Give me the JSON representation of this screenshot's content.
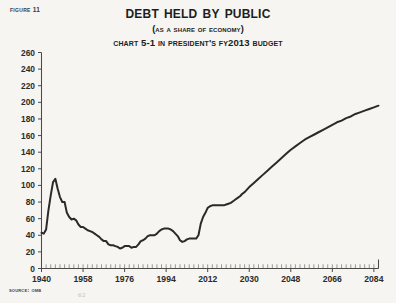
{
  "figure": {
    "label": "Figure 11"
  },
  "titles": {
    "main": "Debt Held by Public",
    "sub1": "(As a Share of Economy)",
    "sub2": "Chart 5-1 in President's FY2013 Budget"
  },
  "source": {
    "text": "Source: OMB"
  },
  "artifact": {
    "page_mark": "62"
  },
  "colors": {
    "background": "#f6f5f2",
    "line": "#2a2a2a",
    "axis": "#4a4a4a",
    "text": "#1d1d1d"
  },
  "chart_data": {
    "type": "line",
    "title": "Debt Held by Public",
    "subtitle": "(As a Share of Economy)",
    "subtitle2": "Chart 5-1 in President's FY2013 Budget",
    "xlabel": "",
    "ylabel": "",
    "xlim": [
      1940,
      2086
    ],
    "ylim": [
      0,
      260
    ],
    "ytick_values": [
      0,
      20,
      40,
      60,
      80,
      100,
      120,
      140,
      160,
      180,
      200,
      220,
      240,
      260
    ],
    "ytick_labels": [
      "0",
      "20",
      "40",
      "60",
      "80",
      "100",
      "120",
      "140",
      "160",
      "180",
      "200",
      "220",
      "240",
      "260"
    ],
    "xtick_values": [
      1940,
      1958,
      1976,
      1994,
      2012,
      2030,
      2048,
      2066,
      2084
    ],
    "xtick_labels": [
      "1940",
      "1958",
      "1976",
      "1994",
      "2012",
      "2030",
      "2048",
      "2066",
      "2084"
    ],
    "xtick_minor_step": 2,
    "grid": false,
    "legend": "none",
    "series": [
      {
        "name": "Debt Held by Public (% of GDP)",
        "x": [
          1940,
          1941,
          1942,
          1943,
          1944,
          1945,
          1946,
          1947,
          1948,
          1949,
          1950,
          1951,
          1952,
          1953,
          1954,
          1955,
          1956,
          1957,
          1958,
          1959,
          1960,
          1961,
          1962,
          1963,
          1964,
          1965,
          1966,
          1967,
          1968,
          1969,
          1970,
          1971,
          1972,
          1973,
          1974,
          1975,
          1976,
          1977,
          1978,
          1979,
          1980,
          1981,
          1982,
          1983,
          1984,
          1985,
          1986,
          1987,
          1988,
          1989,
          1990,
          1991,
          1992,
          1993,
          1994,
          1995,
          1996,
          1997,
          1998,
          1999,
          2000,
          2001,
          2002,
          2003,
          2004,
          2005,
          2006,
          2007,
          2008,
          2009,
          2010,
          2011,
          2012,
          2013,
          2014,
          2015,
          2016,
          2017,
          2018,
          2019,
          2020,
          2021,
          2022,
          2023,
          2024,
          2025,
          2026,
          2027,
          2028,
          2029,
          2030,
          2032,
          2034,
          2036,
          2038,
          2040,
          2042,
          2044,
          2046,
          2048,
          2050,
          2052,
          2054,
          2056,
          2058,
          2060,
          2062,
          2064,
          2066,
          2068,
          2070,
          2072,
          2074,
          2076,
          2078,
          2080,
          2082,
          2084,
          2086
        ],
        "values": [
          43,
          42,
          47,
          70,
          88,
          104,
          108,
          96,
          86,
          80,
          80,
          67,
          62,
          59,
          60,
          58,
          53,
          50,
          50,
          48,
          46,
          45,
          44,
          42,
          40,
          38,
          35,
          33,
          33,
          29,
          28,
          28,
          27,
          26,
          24,
          25,
          27,
          27,
          27,
          25,
          26,
          26,
          29,
          33,
          34,
          36,
          39,
          40,
          40,
          40,
          42,
          45,
          47,
          48,
          48,
          48,
          47,
          45,
          42,
          39,
          34,
          32,
          33,
          35,
          36,
          36,
          36,
          36,
          40,
          54,
          62,
          67,
          73,
          75,
          76,
          76,
          76,
          76,
          76,
          76,
          77,
          78,
          79,
          81,
          83,
          85,
          87,
          90,
          92,
          95,
          98,
          103,
          108,
          113,
          118,
          123,
          128,
          133,
          138,
          143,
          147,
          151,
          155,
          158,
          161,
          164,
          167,
          170,
          173,
          176,
          178,
          181,
          183,
          186,
          188,
          190,
          192,
          194,
          196
        ]
      }
    ],
    "annotations": [
      {
        "note": "WWII peak",
        "x": 1946,
        "y": 108
      },
      {
        "note": "mid-1970s trough",
        "x": 1974,
        "y": 24
      },
      {
        "note": "1990s local peak",
        "x": 1994,
        "y": 48
      },
      {
        "note": "2001 local low",
        "x": 2001,
        "y": 32
      },
      {
        "note": "post-2008 surge plateau",
        "x": 2014,
        "y": 76
      },
      {
        "note": "projection end",
        "x": 2086,
        "y": 196
      }
    ]
  }
}
